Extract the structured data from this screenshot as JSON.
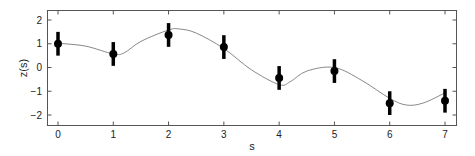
{
  "chart_data": {
    "type": "scatter",
    "title": "",
    "xlabel": "s",
    "ylabel": "z(s)",
    "xlim": [
      -0.2,
      7.2
    ],
    "ylim": [
      -2.4,
      2.4
    ],
    "xticks": [
      0,
      1,
      2,
      3,
      4,
      5,
      6,
      7
    ],
    "yticks": [
      -2,
      -1,
      0,
      1,
      2
    ],
    "grid": false,
    "legend": null,
    "series": [
      {
        "name": "observations",
        "kind": "points_with_errorbars",
        "x": [
          0,
          1,
          2,
          3,
          4,
          5,
          6,
          7
        ],
        "y": [
          1.0,
          0.57,
          1.37,
          0.86,
          -0.44,
          -0.15,
          -1.5,
          -1.4
        ],
        "error": [
          0.5,
          0.5,
          0.5,
          0.5,
          0.5,
          0.5,
          0.5,
          0.5
        ],
        "color": "#000000"
      },
      {
        "name": "fitted curve",
        "kind": "line",
        "x": [
          0,
          0.5,
          1.0,
          1.2,
          1.5,
          2.0,
          2.2,
          2.5,
          3.0,
          3.5,
          4.0,
          4.2,
          4.5,
          5.0,
          5.5,
          6.0,
          6.3,
          6.6,
          7.0
        ],
        "y": [
          1.02,
          0.9,
          0.57,
          0.62,
          1.1,
          1.58,
          1.62,
          1.45,
          0.8,
          -0.1,
          -0.72,
          -0.6,
          -0.15,
          0.0,
          -0.55,
          -1.3,
          -1.58,
          -1.5,
          -1.07
        ],
        "color": "#888888"
      }
    ]
  },
  "axes": {
    "xlabel": "s",
    "ylabel": "z(s)",
    "xtick_labels": [
      "0",
      "1",
      "2",
      "3",
      "4",
      "5",
      "6",
      "7"
    ],
    "ytick_labels": [
      "2",
      "1",
      "0",
      "−1",
      "−2"
    ]
  }
}
